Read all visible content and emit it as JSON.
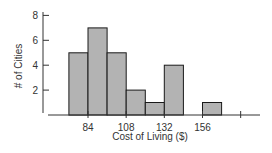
{
  "chart_data": {
    "type": "bar",
    "subtype": "histogram",
    "title": "",
    "xlabel": "Cost of Living ($)",
    "ylabel": "# of Cities",
    "bin_width": 12,
    "bins": [
      {
        "start": 72,
        "end": 84,
        "count": 5
      },
      {
        "start": 84,
        "end": 96,
        "count": 7
      },
      {
        "start": 96,
        "end": 108,
        "count": 5
      },
      {
        "start": 108,
        "end": 120,
        "count": 2
      },
      {
        "start": 120,
        "end": 132,
        "count": 1
      },
      {
        "start": 132,
        "end": 144,
        "count": 4
      },
      {
        "start": 144,
        "end": 156,
        "count": 0
      },
      {
        "start": 156,
        "end": 168,
        "count": 1
      }
    ],
    "categories": [
      "72-84",
      "84-96",
      "96-108",
      "108-120",
      "120-132",
      "132-144",
      "144-156",
      "156-168"
    ],
    "values": [
      5,
      7,
      5,
      2,
      1,
      4,
      0,
      1
    ],
    "x_ticks": [
      "84",
      "108",
      "132",
      "156",
      ""
    ],
    "x_tick_values": [
      84,
      108,
      132,
      156,
      180
    ],
    "y_ticks": [
      "2",
      "4",
      "6",
      "8"
    ],
    "y_tick_values": [
      2,
      4,
      6,
      8
    ],
    "xlim": [
      66,
      186
    ],
    "ylim": [
      0,
      8.5
    ],
    "grid": false,
    "legend": null,
    "colors": {
      "bar_fill": "#b3b3b3",
      "bar_stroke": "#1a1a1a",
      "axis": "#333333"
    }
  }
}
